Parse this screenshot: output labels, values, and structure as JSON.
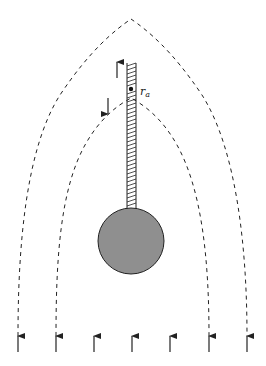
{
  "diagram": {
    "label_r": "r",
    "label_sub": "a",
    "colors": {
      "sphere_fill": "#8f8f8f",
      "stroke": "#222222",
      "background": "#ffffff"
    },
    "flow_arrows_x": [
      18,
      56,
      94,
      132,
      170,
      209,
      247
    ],
    "sphere": {
      "cx": 131,
      "cy": 241,
      "r": 33
    },
    "tether": {
      "x1": 127,
      "x2": 136,
      "y_top": 63,
      "y_bottom": 208
    },
    "point": {
      "cx": 131,
      "cy": 89
    }
  }
}
